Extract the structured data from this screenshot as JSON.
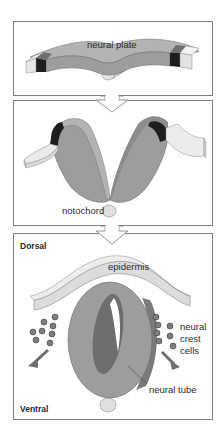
{
  "figure": {
    "panels": [
      {
        "id": "stage-1",
        "labels": {
          "neural_plate": "neural plate"
        }
      },
      {
        "id": "stage-2",
        "labels": {
          "notochord": "notochord"
        }
      },
      {
        "id": "stage-3",
        "labels": {
          "dorsal": "Dorsal",
          "ventral": "Ventral",
          "epidermis": "epidermis",
          "neural_crest_line1": "neural",
          "neural_crest_line2": "crest",
          "neural_crest_line3": "cells",
          "neural_tube": "neural tube"
        }
      }
    ],
    "transitions": [
      {
        "from": "stage-1",
        "to": "stage-2",
        "icon": "down-arrow-icon"
      },
      {
        "from": "stage-2",
        "to": "stage-3",
        "icon": "down-arrow-icon"
      }
    ],
    "colors": {
      "neural_tissue": "#9d9d9d",
      "neural_tissue_dark": "#7a7a7a",
      "neural_tissue_light": "#b3b3b3",
      "neural_crest_band": "#1e1e1e",
      "neural_crest_band_top": "#6f6f6f",
      "epidermis": "#dcdcdc",
      "epidermis_top": "#ececec",
      "notochord": "#d6d6d6",
      "frame": "#7d7d7d",
      "text": "#2b2b2b"
    }
  }
}
